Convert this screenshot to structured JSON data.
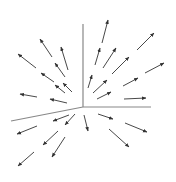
{
  "diagram": {
    "title": "",
    "type": "3d-vector-field",
    "colors": {
      "axis": "#888888",
      "arrow": "#333333",
      "background": "#ffffff"
    },
    "axes": [
      {
        "name": "z-axis",
        "x1": 83,
        "y1": 107,
        "x2": 83,
        "y2": 24
      },
      {
        "name": "y-axis",
        "x1": 83,
        "y1": 107,
        "x2": 151,
        "y2": 107
      },
      {
        "name": "x-axis",
        "x1": 83,
        "y1": 107,
        "x2": 11,
        "y2": 121
      }
    ],
    "arrows": [
      [
        52,
        57,
        40,
        39
      ],
      [
        36,
        68,
        18,
        54
      ],
      [
        68,
        70,
        61,
        47
      ],
      [
        65,
        77,
        55,
        63
      ],
      [
        54,
        82,
        41,
        73
      ],
      [
        72,
        92,
        63,
        83
      ],
      [
        65,
        93,
        55,
        85
      ],
      [
        37,
        97,
        20,
        94
      ],
      [
        67,
        103,
        50,
        99
      ],
      [
        102,
        43,
        108,
        20
      ],
      [
        95,
        65,
        100,
        48
      ],
      [
        103,
        68,
        116,
        48
      ],
      [
        137,
        50,
        154,
        33
      ],
      [
        112,
        74,
        129,
        57
      ],
      [
        145,
        73,
        164,
        63
      ],
      [
        88,
        88,
        92,
        75
      ],
      [
        93,
        93,
        107,
        80
      ],
      [
        123,
        86,
        138,
        78
      ],
      [
        97,
        99,
        111,
        92
      ],
      [
        124,
        99,
        146,
        98
      ],
      [
        69,
        115,
        53,
        121
      ],
      [
        75,
        114,
        65,
        125
      ],
      [
        37,
        126,
        17,
        134
      ],
      [
        84,
        115,
        88,
        131
      ],
      [
        98,
        114,
        113,
        119
      ],
      [
        125,
        123,
        147,
        132
      ],
      [
        58,
        131,
        43,
        145
      ],
      [
        65,
        137,
        52,
        157
      ],
      [
        109,
        129,
        129,
        147
      ],
      [
        34,
        152,
        18,
        166
      ]
    ]
  }
}
